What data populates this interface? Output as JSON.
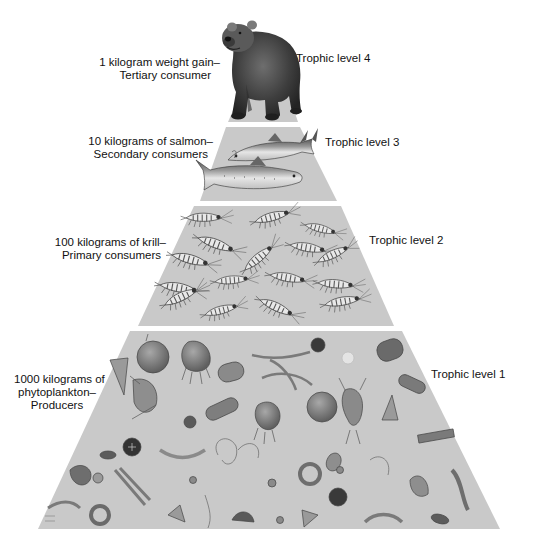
{
  "diagram": {
    "type": "ecological-pyramid",
    "colors": {
      "background": "#ffffff",
      "tier_fill": "#c8c8c8",
      "separator": "#ffffff",
      "text": "#111111"
    },
    "tiers": [
      {
        "level_label": "Trophic level 4",
        "mass_label_line1": "1 kilogram weight gain–",
        "mass_label_line2": "Tertiary consumer",
        "organism": "bear",
        "mass_kg": 1,
        "role": "Tertiary consumer"
      },
      {
        "level_label": "Trophic level 3",
        "mass_label_line1": "10 kilograms of salmon–",
        "mass_label_line2": "Secondary consumers",
        "organism": "salmon",
        "mass_kg": 10,
        "role": "Secondary consumers"
      },
      {
        "level_label": "Trophic level 2",
        "mass_label_line1": "100 kilograms of krill–",
        "mass_label_line2": "Primary consumers",
        "organism": "krill",
        "mass_kg": 100,
        "role": "Primary consumers"
      },
      {
        "level_label": "Trophic level 1",
        "mass_label_line1": "1000 kilograms of",
        "mass_label_line2": "phytoplankton–",
        "mass_label_line3": "Producers",
        "organism": "phytoplankton",
        "mass_kg": 1000,
        "role": "Producers"
      }
    ]
  }
}
